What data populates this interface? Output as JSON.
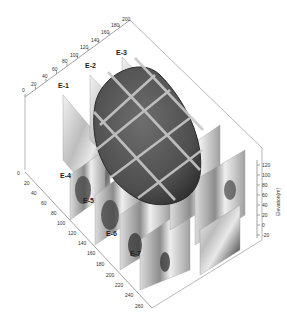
{
  "figure": {
    "type": "3d-geological-block-diagram",
    "sections": [
      "E-1",
      "E-2",
      "E-3",
      "E-4",
      "E-5",
      "E-6",
      "E-7"
    ],
    "axes": {
      "top_axis": {
        "ticks": [
          "0",
          "20",
          "40",
          "60",
          "80",
          "100",
          "120",
          "140",
          "160",
          "180",
          "200"
        ]
      },
      "left_axis": {
        "ticks": [
          "0",
          "20",
          "40",
          "60",
          "80",
          "100",
          "120",
          "140",
          "160",
          "180",
          "200",
          "220",
          "240",
          "260"
        ]
      },
      "vertical_axis": {
        "label": "Elevation(m)",
        "ticks": [
          "120",
          "100",
          "80",
          "60",
          "40",
          "20",
          "0",
          "-20"
        ]
      }
    },
    "colors": {
      "body": "#5a5a5a",
      "body_edge": "#2a2a2a",
      "grid_band": "#c8c8c8",
      "section_light": "#e6e6e6",
      "section_dark": "#4a4a4a",
      "axis": "#8a8a8a"
    }
  }
}
